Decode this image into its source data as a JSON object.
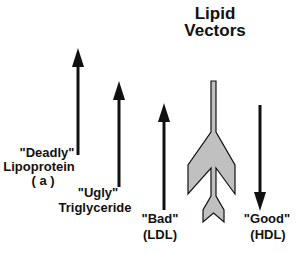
{
  "title": {
    "line1": "Lipid",
    "line2": "Vectors"
  },
  "vectors": [
    {
      "name": "Deadly",
      "quote": "\"Deadly\"",
      "line2": "Lipoprotein",
      "line3": "( a )",
      "direction": "up"
    },
    {
      "name": "Ugly",
      "quote": "\"Ugly\"",
      "line2": "Triglyceride",
      "direction": "up"
    },
    {
      "name": "Bad",
      "quote": "\"Bad\"",
      "line2": "(LDL)",
      "direction": "up"
    },
    {
      "name": "Good",
      "quote": "\"Good\"",
      "line2": "(HDL)",
      "direction": "down"
    }
  ],
  "colors": {
    "arrow": "#111111",
    "resultant_fill": "#c0c0c0",
    "resultant_stroke": "#111111",
    "background": "#ffffff"
  }
}
